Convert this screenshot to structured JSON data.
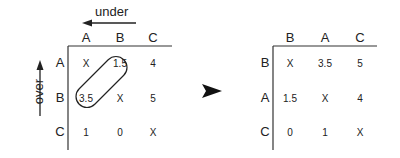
{
  "left_matrix": {
    "top_label": "under",
    "side_label": "over",
    "columns": [
      "A",
      "B",
      "C"
    ],
    "rows": [
      {
        "label": "A",
        "cells": [
          "X",
          "1.5",
          "4"
        ]
      },
      {
        "label": "B",
        "cells": [
          "3.5",
          "X",
          "5"
        ]
      },
      {
        "label": "C",
        "cells": [
          "1",
          "0",
          "X"
        ]
      }
    ],
    "highlighted_cells": [
      "1.5",
      "3.5"
    ]
  },
  "arrow_icon": "right-arrowhead",
  "right_matrix": {
    "columns": [
      "B",
      "A",
      "C"
    ],
    "rows": [
      {
        "label": "B",
        "cells": [
          "X",
          "3.5",
          "5"
        ]
      },
      {
        "label": "A",
        "cells": [
          "1.5",
          "X",
          "4"
        ]
      },
      {
        "label": "C",
        "cells": [
          "0",
          "1",
          "X"
        ]
      }
    ]
  }
}
